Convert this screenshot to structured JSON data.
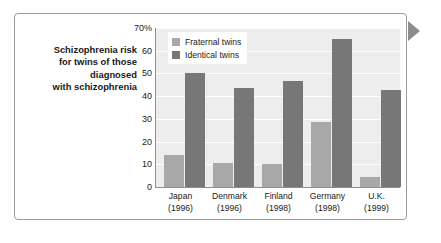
{
  "caption": {
    "lines": [
      "Schizophrenia risk",
      "for twins of those",
      "diagnosed",
      "with schizophrenia"
    ]
  },
  "legend": {
    "position": "top-left-inside",
    "entries": [
      {
        "label": "Fraternal twins",
        "color": "#a8a8a8",
        "swatch": "legend-swatch-fraternal"
      },
      {
        "label": "Identical twins",
        "color": "#777777",
        "swatch": "legend-swatch-identical"
      }
    ]
  },
  "axes": {
    "y_ticks": [
      "70%",
      "60",
      "50",
      "40",
      "30",
      "20",
      "10",
      "0"
    ],
    "x_labels": [
      {
        "name": "Japan",
        "year": "(1996)"
      },
      {
        "name": "Denmark",
        "year": "(1996)"
      },
      {
        "name": "Finland",
        "year": "(1998)"
      },
      {
        "name": "Germany",
        "year": "(1998)"
      },
      {
        "name": "U.K.",
        "year": "(1999)"
      }
    ]
  },
  "marker": {
    "name": "right-arrow-marker",
    "color": "#8c8c8c"
  },
  "colors": {
    "fraternal": "#a8a8a8",
    "identical": "#777777",
    "plot_background": "#ededed",
    "gridline": "#ffffff",
    "axis": "#8e8e8e",
    "frame_border": "#9a9a9a",
    "text": "#1a1a1a"
  },
  "chart_data": {
    "type": "bar",
    "title": "Schizophrenia risk for twins of those diagnosed with schizophrenia",
    "xlabel": "",
    "ylabel": "",
    "ylim": [
      0,
      70
    ],
    "yticks": [
      0,
      10,
      20,
      30,
      40,
      50,
      60,
      70
    ],
    "ytick_labels": [
      "0",
      "10",
      "20",
      "30",
      "40",
      "50",
      "60",
      "70%"
    ],
    "grid": true,
    "legend_position": "upper left",
    "categories": [
      "Japan (1996)",
      "Denmark (1996)",
      "Finland (1998)",
      "Germany (1998)",
      "U.K. (1999)"
    ],
    "series": [
      {
        "name": "Fraternal twins",
        "color": "#a8a8a8",
        "values": [
          14,
          10.5,
          10,
          28.5,
          4.5
        ]
      },
      {
        "name": "Identical twins",
        "color": "#777777",
        "values": [
          50,
          43.5,
          46.5,
          65,
          42.5
        ]
      }
    ]
  }
}
